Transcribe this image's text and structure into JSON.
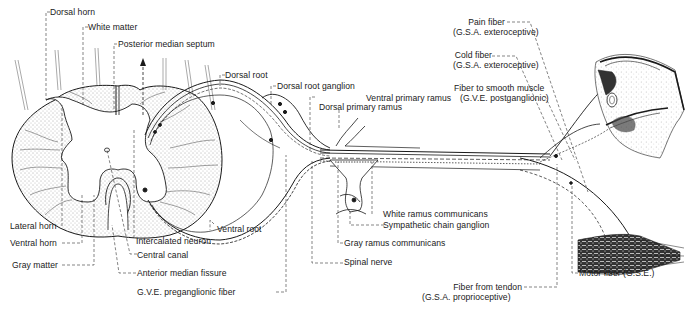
{
  "diagram": {
    "colors": {
      "ink": "#1a1a1a",
      "background": "#ffffff",
      "stipple": "#555555"
    },
    "labels": {
      "dorsal_horn": "Dorsal horn",
      "white_matter": "White matter",
      "posterior_median_septum": "Posterior median septum",
      "dorsal_root": "Dorsal root",
      "dorsal_root_ganglion": "Dorsal root ganglion",
      "dorsal_primary_ramus": "Dorsal primary ramus",
      "ventral_primary_ramus": "Ventral primary ramus",
      "pain_fiber": "Pain fiber",
      "pain_fiber_type": "(G.S.A. exteroceptive)",
      "cold_fiber": "Cold fiber",
      "cold_fiber_type": "(G.S.A. exteroceptive)",
      "smooth_muscle_fiber": "Fiber to smooth muscle",
      "smooth_muscle_fiber_type": "(G.V.E. postganglionic)",
      "lateral_horn": "Lateral horn",
      "ventral_horn": "Ventral horn",
      "gray_matter": "Gray matter",
      "intercalated_neuron": "Intercalated neuron",
      "central_canal": "Central canal",
      "anterior_median_fissure": "Anterior median fissure",
      "gve_preganglionic_fiber": "G.V.E. preganglionic fiber",
      "ventral_root": "Ventral root",
      "white_ramus": "White ramus communicans",
      "sympathetic_chain_ganglion": "Sympathetic chain ganglion",
      "gray_ramus": "Gray ramus communicans",
      "spinal_nerve": "Spinal nerve",
      "fiber_from_tendon": "Fiber from tendon",
      "fiber_from_tendon_type": "(G.S.A. proprioceptive)",
      "motor_fiber": "Motor fiber (G.S.E.)",
      "artist_initials": "J.C.B."
    }
  }
}
